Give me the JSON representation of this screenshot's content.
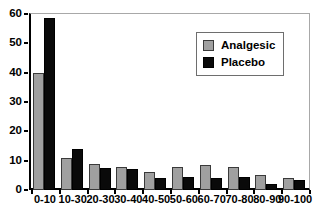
{
  "chart_data": {
    "type": "bar",
    "title": "",
    "xlabel": "",
    "ylabel": "",
    "ylim": [
      0,
      60
    ],
    "yticks": [
      0,
      10,
      20,
      30,
      40,
      50,
      60
    ],
    "grid": false,
    "legend_position": "top-right",
    "categories": [
      "0-10",
      "10-30",
      "20-30",
      "30-40",
      "40-50",
      "50-60",
      "60-70",
      "70-80",
      "80-90",
      "90-100"
    ],
    "series": [
      {
        "name": "Analgesic",
        "color": "#a0a0a0",
        "values": [
          40,
          11,
          9,
          8,
          6,
          8,
          8.5,
          8,
          5,
          4
        ]
      },
      {
        "name": "Placebo",
        "color": "#0a0a0a",
        "values": [
          58.5,
          14,
          7.5,
          7,
          4,
          4.5,
          4,
          4.5,
          2,
          3.5
        ]
      }
    ]
  },
  "legend": {
    "items": [
      {
        "label": "Analgesic",
        "swatch": "analgesic"
      },
      {
        "label": "Placebo",
        "swatch": "placebo"
      }
    ]
  }
}
